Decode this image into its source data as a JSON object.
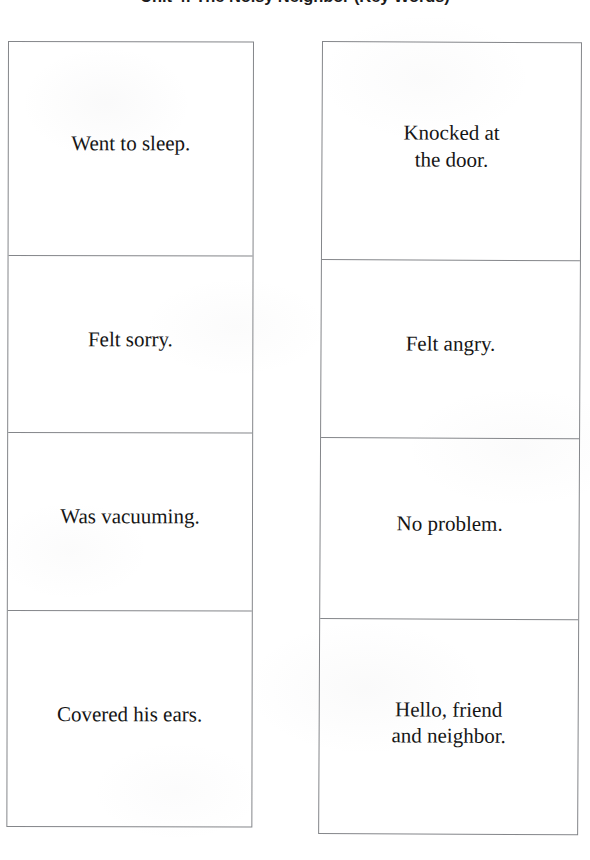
{
  "page": {
    "heading": "Unit 4: The Noisy Neighbor (Key Words)",
    "border_color": "#84868a",
    "text_color": "#151515",
    "background_color": "#ffffff"
  },
  "left_table": {
    "name": "left-card-column",
    "cells": [
      {
        "text": "Went to sleep."
      },
      {
        "text": "Felt sorry."
      },
      {
        "text": "Was vacuuming."
      },
      {
        "text": "Covered his ears."
      }
    ]
  },
  "right_table": {
    "name": "right-card-column",
    "cells": [
      {
        "line1": "Knocked at",
        "line2": "the door."
      },
      {
        "line1": "Felt angry.",
        "line2": ""
      },
      {
        "line1": "No problem.",
        "line2": ""
      },
      {
        "line1": "Hello, friend",
        "line2": "and neighbor."
      }
    ]
  }
}
